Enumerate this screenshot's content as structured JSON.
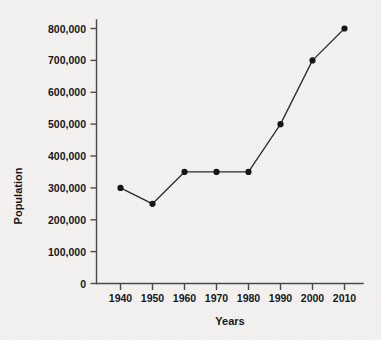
{
  "chart_data": {
    "type": "line",
    "title": "",
    "xlabel": "Years",
    "ylabel": "Population",
    "categories": [
      1940,
      1950,
      1960,
      1970,
      1980,
      1990,
      2000,
      2010
    ],
    "x_tick_labels": [
      "1940",
      "1950",
      "1960",
      "1970",
      "1980",
      "1990",
      "2000",
      "2010"
    ],
    "values": [
      300000,
      250000,
      350000,
      350000,
      350000,
      500000,
      700000,
      800000
    ],
    "y_tick_labels": [
      "0",
      "100,000",
      "200,000",
      "300,000",
      "400,000",
      "500,000",
      "600,000",
      "700,000",
      "800,000"
    ],
    "y_tick_values": [
      0,
      100000,
      200000,
      300000,
      400000,
      500000,
      600000,
      700000,
      800000
    ],
    "xlim": [
      1935,
      2015
    ],
    "ylim": [
      0,
      800000
    ],
    "grid": false,
    "legend": false,
    "legend_position": "none",
    "marker": "filled-circle",
    "line_color": "#2b2b2e",
    "marker_color": "#161618",
    "background_color": "#f2f1ef",
    "axis_color": "#4a4a4d"
  }
}
